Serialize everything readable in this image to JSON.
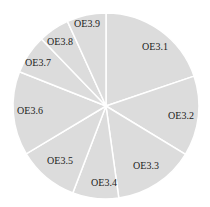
{
  "chart_data": {
    "type": "pie",
    "title": "",
    "start_angle": "top (12 o'clock), clockwise",
    "categories": [
      "OE3.1",
      "OE3.2",
      "OE3.3",
      "OE3.4",
      "OE3.5",
      "OE3.6",
      "OE3.7",
      "OE3.8",
      "OE3.9"
    ],
    "values": [
      19.8,
      13.9,
      14.1,
      8.0,
      10.6,
      14.6,
      6.8,
      5.4,
      6.8
    ],
    "unit": "% (estimated from slice angles)",
    "slice_color": "#dcdcdc",
    "divider_color": "#ffffff",
    "legend": "none (labels inside slices)"
  },
  "labels": {
    "s1": "OE3.1",
    "s2": "OE3.2",
    "s3": "OE3.3",
    "s4": "OE3.4",
    "s5": "OE3.5",
    "s6": "OE3.6",
    "s7": "OE3.7",
    "s8": "OE3.8",
    "s9": "OE3.9"
  }
}
